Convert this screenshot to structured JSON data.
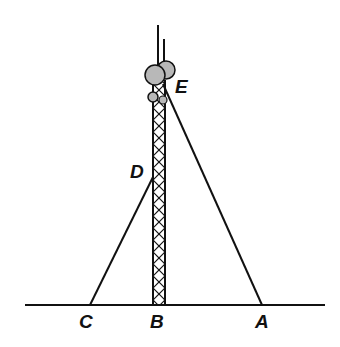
{
  "diagram": {
    "colors": {
      "line": "#111111",
      "dish": "#b8b8b8",
      "background": "#ffffff"
    },
    "points": {
      "A": {
        "label": "A",
        "x": 262,
        "y": 305
      },
      "B": {
        "label": "B",
        "x": 159,
        "y": 305
      },
      "C": {
        "label": "C",
        "x": 90,
        "y": 305
      },
      "D": {
        "label": "D",
        "x": 153,
        "y": 177
      },
      "E": {
        "label": "E",
        "x": 163,
        "y": 84
      }
    },
    "labels": {
      "A": "A",
      "B": "B",
      "C": "C",
      "D": "D",
      "E": "E"
    },
    "ground": {
      "x1": 25,
      "x2": 325,
      "y": 305
    },
    "tower": {
      "x_left": 153,
      "x_right": 165,
      "top": 80,
      "bottom": 305
    },
    "cables": [
      {
        "from": "E",
        "to": "A"
      },
      {
        "from": "D",
        "to": "C"
      }
    ]
  }
}
